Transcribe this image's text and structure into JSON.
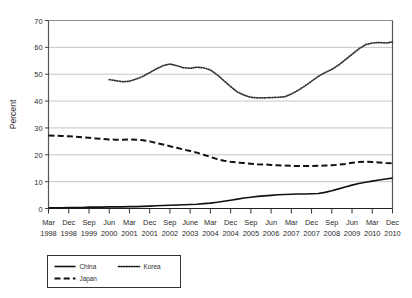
{
  "chart_data": {
    "type": "line",
    "title": "",
    "xlabel": "",
    "ylabel": "Percent",
    "ylim": [
      0,
      70
    ],
    "yticks": [
      0,
      10,
      20,
      30,
      40,
      50,
      60,
      70
    ],
    "grid": true,
    "legend_position": "bottom-left",
    "categories": [
      "Mar 1998",
      "Jun 1998",
      "Sep 1998",
      "Dec 1998",
      "Mar 1999",
      "Jun 1999",
      "Sep 1999",
      "Dec 1999",
      "Mar 2000",
      "Jun 2000",
      "Sep 2000",
      "Dec 2000",
      "Mar 2001",
      "Jun 2001",
      "Sep 2001",
      "Dec 2001",
      "Mar 2002",
      "Jun 2002",
      "Sep 2002",
      "Dec 2002",
      "Mar 2003",
      "Jun 2003",
      "Sep 2003",
      "Dec 2003",
      "Mar 2004",
      "Jun 2004",
      "Sep 2004",
      "Dec 2004",
      "Mar 2005",
      "Jun 2005",
      "Sep 2005",
      "Dec 2005",
      "Mar 2006",
      "Jun 2006",
      "Sep 2006",
      "Dec 2006",
      "Mar 2007",
      "Jun 2007",
      "Sep 2007",
      "Dec 2007",
      "Mar 2008",
      "Jun 2008",
      "Sep 2008",
      "Dec 2008",
      "Mar 2009",
      "Jun 2009",
      "Sep 2009",
      "Dec 2009",
      "Mar 2010",
      "Jun 2010",
      "Sep 2010",
      "Dec 2010"
    ],
    "xtick_labels": [
      {
        "month": "Mar",
        "year": "1998"
      },
      {
        "month": "Dec",
        "year": "1998"
      },
      {
        "month": "Sep",
        "year": "1999"
      },
      {
        "month": "Jun",
        "year": "2000"
      },
      {
        "month": "Mar",
        "year": "2001"
      },
      {
        "month": "Dec",
        "year": "2001"
      },
      {
        "month": "Sep",
        "year": "2002"
      },
      {
        "month": "June",
        "year": "2003"
      },
      {
        "month": "Mar",
        "year": "2004"
      },
      {
        "month": "Dec",
        "year": "2004"
      },
      {
        "month": "Sep",
        "year": "2005"
      },
      {
        "month": "Jun",
        "year": "2006"
      },
      {
        "month": "Mar",
        "year": "2007"
      },
      {
        "month": "Dec",
        "year": "2007"
      },
      {
        "month": "Sep",
        "year": "2008"
      },
      {
        "month": "Jun",
        "year": "2009"
      },
      {
        "month": "Mar",
        "year": "2010"
      },
      {
        "month": "Dec",
        "year": "2010"
      }
    ],
    "series": [
      {
        "name": "China",
        "style": "solid",
        "color": "#111111",
        "values": [
          0.3,
          0.3,
          0.3,
          0.4,
          0.4,
          0.4,
          0.5,
          0.5,
          0.5,
          0.6,
          0.6,
          0.6,
          0.7,
          0.7,
          0.8,
          0.9,
          1.0,
          1.1,
          1.2,
          1.3,
          1.4,
          1.5,
          1.6,
          1.8,
          2.0,
          2.3,
          2.7,
          3.1,
          3.5,
          3.9,
          4.2,
          4.5,
          4.7,
          4.9,
          5.1,
          5.2,
          5.3,
          5.4,
          5.4,
          5.5,
          5.6,
          6.0,
          6.6,
          7.3,
          8.0,
          8.7,
          9.3,
          9.8,
          10.2,
          10.6,
          11.0,
          11.3
        ]
      },
      {
        "name": "Korea",
        "style": "dotted",
        "color": "#333333",
        "values": [
          null,
          null,
          null,
          null,
          null,
          null,
          null,
          null,
          null,
          48.0,
          47.6,
          47.2,
          47.4,
          48.2,
          49.2,
          50.6,
          52.0,
          53.2,
          53.8,
          53.2,
          52.4,
          52.2,
          52.6,
          52.4,
          51.6,
          49.8,
          47.6,
          45.4,
          43.4,
          42.2,
          41.4,
          41.2,
          41.2,
          41.3,
          41.4,
          41.6,
          42.6,
          44.0,
          45.6,
          47.4,
          49.2,
          50.6,
          51.8,
          53.4,
          55.4,
          57.4,
          59.4,
          61.0,
          61.6,
          61.8,
          61.6,
          62.0
        ]
      },
      {
        "name": "Japan",
        "style": "dashed",
        "color": "#111111",
        "values": [
          27.2,
          27.1,
          27.0,
          26.9,
          26.7,
          26.5,
          26.3,
          26.1,
          25.9,
          25.7,
          25.6,
          25.6,
          25.7,
          25.6,
          25.4,
          25.0,
          24.4,
          23.8,
          23.2,
          22.6,
          22.0,
          21.4,
          20.8,
          20.0,
          19.2,
          18.4,
          17.8,
          17.4,
          17.1,
          16.9,
          16.7,
          16.5,
          16.4,
          16.2,
          16.1,
          16.0,
          15.9,
          15.8,
          15.8,
          15.8,
          15.9,
          16.0,
          16.1,
          16.3,
          16.6,
          17.0,
          17.3,
          17.4,
          17.3,
          17.1,
          16.9,
          16.8
        ]
      }
    ]
  },
  "legend": {
    "items": [
      {
        "label": "China",
        "style": "solid"
      },
      {
        "label": "Korea",
        "style": "dotted"
      },
      {
        "label": "Japan",
        "style": "dashed"
      }
    ]
  }
}
